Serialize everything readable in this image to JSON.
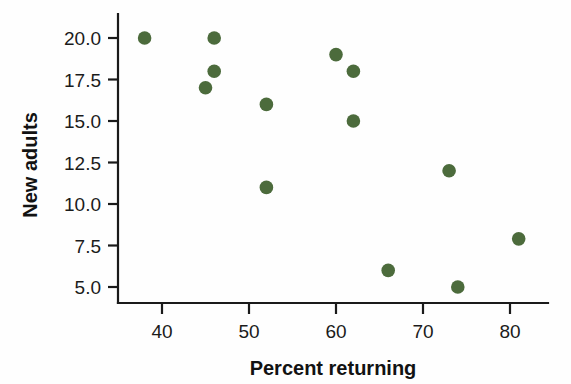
{
  "chart_data": {
    "type": "scatter",
    "title": "",
    "xlabel": "Percent returning",
    "ylabel": "New adults",
    "xlim": [
      34,
      84
    ],
    "ylim": [
      3.6,
      21.2
    ],
    "xticks": [
      40,
      50,
      60,
      70,
      80
    ],
    "xtick_labels": [
      "40",
      "50",
      "60",
      "70",
      "80"
    ],
    "yticks": [
      5.0,
      7.5,
      10.0,
      12.5,
      15.0,
      17.5,
      20.0
    ],
    "ytick_labels": [
      "5.0",
      "7.5",
      "10.0",
      "12.5",
      "15.0",
      "17.5",
      "20.0"
    ],
    "grid": false,
    "legend": null,
    "marker_color": "#4c6b3c",
    "marker_size": 9,
    "series": [
      {
        "name": "Colonies",
        "points": [
          {
            "x": 38,
            "y": 20.0
          },
          {
            "x": 45,
            "y": 17.0
          },
          {
            "x": 46,
            "y": 20.0
          },
          {
            "x": 46,
            "y": 18.0
          },
          {
            "x": 52,
            "y": 16.0
          },
          {
            "x": 52,
            "y": 11.0
          },
          {
            "x": 60,
            "y": 19.0
          },
          {
            "x": 62,
            "y": 18.0
          },
          {
            "x": 62,
            "y": 15.0
          },
          {
            "x": 66,
            "y": 6.0
          },
          {
            "x": 73,
            "y": 12.0
          },
          {
            "x": 74,
            "y": 5.0
          },
          {
            "x": 81,
            "y": 7.9
          }
        ]
      }
    ]
  },
  "axes": {
    "x_axis_name": "percent-returning-axis",
    "y_axis_name": "new-adults-axis"
  }
}
